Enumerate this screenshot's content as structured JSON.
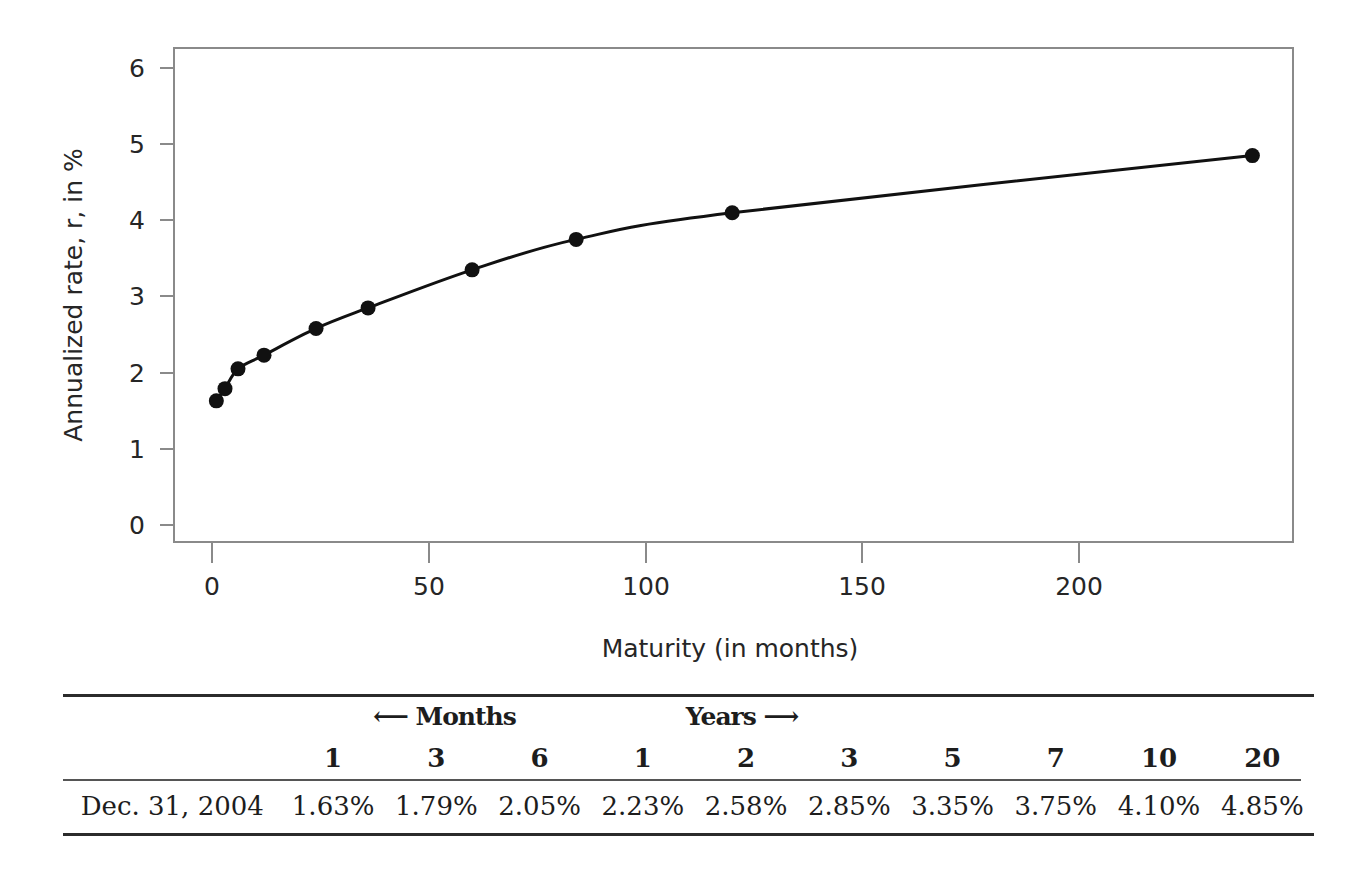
{
  "chart_data": {
    "type": "line",
    "title": "",
    "xlabel": "Maturity (in months)",
    "ylabel": "Annualized rate, r, in %",
    "xlim": [
      -5,
      258
    ],
    "ylim": [
      -0.22,
      6.2
    ],
    "xticks": [
      0,
      50,
      100,
      150,
      200
    ],
    "yticks": [
      0,
      1,
      2,
      3,
      4,
      5,
      6
    ],
    "grid": false,
    "legend": "none",
    "markers": "filled-circle",
    "series": [
      {
        "name": "Dec. 31, 2004 yield curve",
        "x": [
          1,
          3,
          6,
          12,
          24,
          36,
          60,
          84,
          120,
          240
        ],
        "y": [
          1.63,
          1.79,
          2.05,
          2.23,
          2.58,
          2.85,
          3.35,
          3.75,
          4.1,
          4.85
        ]
      }
    ]
  },
  "chart": {
    "xlabel": "Maturity (in months)",
    "ylabel": "Annualized rate, r, in %",
    "xtick_labels": [
      "0",
      "50",
      "100",
      "150",
      "200"
    ],
    "ytick_labels": [
      "0",
      "1",
      "2",
      "3",
      "4",
      "5",
      "6"
    ],
    "line_color": "#111111",
    "marker_color": "#111111",
    "frame_color": "#808080"
  },
  "table": {
    "group_headers": {
      "months": "⟵  Months",
      "years": "Years  ⟶"
    },
    "column_headers": [
      "1",
      "3",
      "6",
      "1",
      "2",
      "3",
      "5",
      "7",
      "10",
      "20"
    ],
    "row": {
      "date": "Dec. 31, 2004",
      "values": [
        "1.63%",
        "1.79%",
        "2.05%",
        "2.23%",
        "2.58%",
        "2.85%",
        "3.35%",
        "3.75%",
        "4.10%",
        "4.85%"
      ]
    }
  }
}
